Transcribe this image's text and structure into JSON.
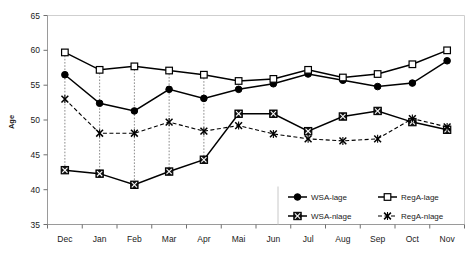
{
  "chart_data": {
    "type": "line",
    "title": "",
    "xlabel": "",
    "ylabel": "Age",
    "ylim": [
      35,
      65
    ],
    "yticks": [
      35,
      40,
      45,
      50,
      55,
      60,
      65
    ],
    "grid": false,
    "legend_position": "bottom-right",
    "categories": [
      "Dec",
      "Jan",
      "Feb",
      "Mar",
      "Apr",
      "Mai",
      "Jun",
      "Jul",
      "Aug",
      "Sep",
      "Oct",
      "Nov"
    ],
    "series": [
      {
        "name": "WSA-lage",
        "marker": "filled-circle",
        "line": "solid",
        "color": "#000000",
        "values": [
          56.5,
          52.4,
          51.3,
          54.4,
          53.1,
          54.4,
          55.2,
          56.6,
          55.7,
          54.8,
          55.3,
          58.5
        ]
      },
      {
        "name": "RegA-lage",
        "marker": "open-square",
        "line": "solid",
        "color": "#000000",
        "values": [
          59.7,
          57.2,
          57.7,
          57.1,
          56.5,
          55.6,
          55.9,
          57.2,
          56.1,
          56.6,
          58.0,
          60.0
        ]
      },
      {
        "name": "WSA-nlage",
        "marker": "filled-square-x",
        "line": "solid",
        "color": "#000000",
        "values": [
          42.8,
          42.3,
          40.7,
          42.6,
          44.3,
          50.9,
          50.9,
          48.4,
          50.5,
          51.3,
          49.7,
          48.6
        ]
      },
      {
        "name": "RegA-nlage",
        "marker": "x-cross",
        "line": "dashed",
        "color": "#000000",
        "values": [
          53.0,
          48.1,
          48.1,
          49.7,
          48.4,
          49.2,
          48.0,
          47.3,
          47.0,
          47.3,
          50.2,
          49.0
        ]
      }
    ],
    "drop_lines": {
      "description": "vertical dotted connectors between lage and nlage series",
      "months": [
        "Dec",
        "Jan",
        "Feb",
        "Mar",
        "Apr"
      ]
    }
  },
  "legend": {
    "entries": [
      {
        "label": "WSA-lage",
        "marker": "filled-circle"
      },
      {
        "label": "RegA-lage",
        "marker": "open-square"
      },
      {
        "label": "WSA-nlage",
        "marker": "filled-square-x"
      },
      {
        "label": "RegA-nlage",
        "marker": "x-cross"
      }
    ]
  },
  "axes": {
    "y_title": "Age",
    "y_tick_labels": [
      "65",
      "60",
      "55",
      "50",
      "45",
      "40",
      "35"
    ],
    "x_tick_labels": [
      "Dec",
      "Jan",
      "Feb",
      "Mar",
      "Apr",
      "Mai",
      "Jun",
      "Jul",
      "Aug",
      "Sep",
      "Oct",
      "Nov"
    ]
  },
  "colors": {
    "ink": "#000000",
    "axis": "#9a9a9a",
    "dropline": "#8a8a8a",
    "background": "#ffffff"
  }
}
